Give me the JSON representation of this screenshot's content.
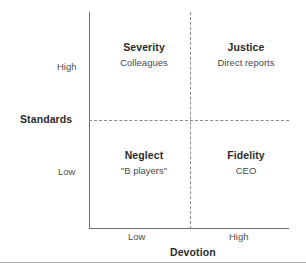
{
  "chart_data": {
    "type": "table",
    "title": "",
    "subtitle": "",
    "xlabel": "Devotion",
    "ylabel": "Standards",
    "x_ticks": [
      "Low",
      "High"
    ],
    "y_ticks": [
      "High",
      "Low"
    ],
    "grid": false,
    "legend": "none",
    "axis_style": {
      "x_axis": "solid",
      "y_axis": "solid",
      "midline_horizontal": "dashed",
      "midline_vertical": "dashed"
    },
    "quadrants": [
      {
        "position": "top-left",
        "x": "Low Devotion",
        "y": "High Standards",
        "title": "Severity",
        "example": "Colleagues"
      },
      {
        "position": "top-right",
        "x": "High Devotion",
        "y": "High Standards",
        "title": "Justice",
        "example": "Direct reports"
      },
      {
        "position": "bottom-left",
        "x": "Low Devotion",
        "y": "Low Standards",
        "title": "Neglect",
        "example": "\"B players\""
      },
      {
        "position": "bottom-right",
        "x": "High Devotion",
        "y": "Low Standards",
        "title": "Fidelity",
        "example": "CEO"
      }
    ],
    "colors": {
      "axis": "#6e6e6e",
      "divider": "#8b8b8b",
      "title_text": "#2b2b2b",
      "body_text": "#4a4a4a",
      "background": "#ffffff"
    }
  }
}
